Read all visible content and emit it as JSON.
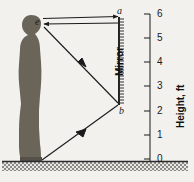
{
  "figure": {
    "type": "optics-ray-diagram",
    "background_color": "#f2f1ee",
    "ink_color": "#1a1a1a"
  },
  "labels": {
    "eye": "e",
    "mirror_top": "a",
    "mirror_bottom": "b",
    "mirror": "Mirror",
    "axis_title": "Height, ft"
  },
  "axis": {
    "orientation": "vertical",
    "unit": "ft",
    "ticks": [
      {
        "value": "6",
        "y": 14
      },
      {
        "value": "5",
        "y": 38
      },
      {
        "value": "4",
        "y": 62
      },
      {
        "value": "3",
        "y": 86
      },
      {
        "value": "2",
        "y": 111
      },
      {
        "value": "1",
        "y": 135
      },
      {
        "value": "0",
        "y": 159
      }
    ],
    "line_x": 150,
    "label_x": 157
  },
  "geometry": {
    "eye_point": {
      "x": 42,
      "y": 22,
      "height_ft": 5.7
    },
    "feet_point": {
      "x": 42,
      "y": 159,
      "height_ft": 0
    },
    "mirror_top_point": {
      "x": 119,
      "y": 18,
      "height_ft": 5.85
    },
    "mirror_bottom_point": {
      "x": 119,
      "y": 104,
      "height_ft": 2.85
    },
    "mirror_x": 119,
    "ground_y": 162
  },
  "colors": {
    "silhouette": "#6b6458",
    "mirror_bar": "#3a3a3a",
    "ray": "#1a1a1a",
    "ground": "#8a8a86"
  },
  "rays": [
    {
      "name": "eye-to-mirror-top-outgoing",
      "from": "e",
      "to": "a",
      "arrow": "forward"
    },
    {
      "name": "mirror-top-to-eye-return",
      "from": "a",
      "to": "e",
      "arrow": "forward"
    },
    {
      "name": "mirror-bottom-to-eye",
      "from": "b",
      "to": "e",
      "arrow": "forward"
    },
    {
      "name": "feet-to-mirror-bottom",
      "from": "feet",
      "to": "b",
      "arrow": "backward"
    }
  ]
}
